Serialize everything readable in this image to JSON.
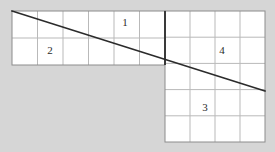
{
  "figure": {
    "canvas": {
      "width": 275,
      "height": 152
    },
    "colors": {
      "background": "#d6d6d6",
      "cell_fill": "#ffffff",
      "grid_line": "#b9b9b9",
      "border_line": "#8c8c8c",
      "divider_line": "#3a3a3a",
      "diagonal_line": "#2b2b2b",
      "label_text": "#2b2b2b"
    },
    "blocks": [
      {
        "name": "upper-left-block",
        "x": 12,
        "y": 11,
        "width": 153,
        "height": 54,
        "columns": 6,
        "rows": 2
      },
      {
        "name": "right-block",
        "x": 165,
        "y": 11,
        "width": 100,
        "height": 131,
        "columns": 4,
        "rows": 5
      }
    ],
    "divider": {
      "name": "vertical-divider",
      "x": 165,
      "y1": 11,
      "y2": 65,
      "width": 2
    },
    "diagonal": {
      "name": "diagonal-line",
      "x1": 12,
      "y1": 11,
      "x2": 265,
      "y2": 91,
      "width": 1.6
    },
    "labels": [
      {
        "name": "region-label-1",
        "text": "1",
        "x": 125,
        "y": 22
      },
      {
        "name": "region-label-2",
        "text": "2",
        "x": 50,
        "y": 50
      },
      {
        "name": "region-label-3",
        "text": "3",
        "x": 205,
        "y": 107
      },
      {
        "name": "region-label-4",
        "text": "4",
        "x": 222,
        "y": 50
      }
    ]
  }
}
